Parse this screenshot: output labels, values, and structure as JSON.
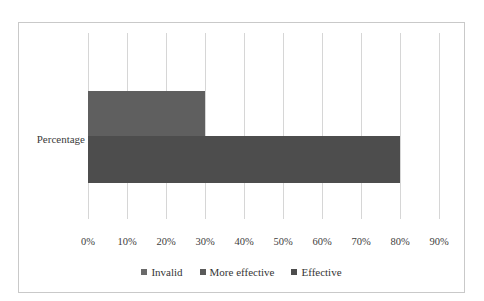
{
  "chart_data": {
    "type": "bar",
    "orientation": "horizontal",
    "stacked": true,
    "title": "",
    "xlabel": "",
    "ylabel": "",
    "categories": [
      "Percentage"
    ],
    "series": [
      {
        "name": "Invalid",
        "values": [
          30
        ],
        "color": "#5f5f5f"
      },
      {
        "name": "More effective",
        "values": [
          50
        ],
        "color": "#4d4d4d"
      },
      {
        "name": "Effective",
        "values": [
          0
        ],
        "color": "#4d4d4d"
      }
    ],
    "xlim": [
      0,
      90
    ],
    "xticks": [
      0,
      10,
      20,
      30,
      40,
      50,
      60,
      70,
      80,
      90
    ],
    "xtick_labels": [
      "0%",
      "10%",
      "20%",
      "30%",
      "40%",
      "50%",
      "60%",
      "70%",
      "80%",
      "90%"
    ],
    "grid": true,
    "grid_axis": "x",
    "legend_position": "bottom",
    "border_color": "#c9c9c9",
    "gridline_color": "#d6d6d6",
    "background": "#ffffff"
  },
  "legend": {
    "items": [
      {
        "label": "Invalid",
        "color": "#6a6a6a"
      },
      {
        "label": "More effective",
        "color": "#5a5a5a"
      },
      {
        "label": "Effective",
        "color": "#4d4d4d"
      }
    ]
  },
  "category_label": "Percentage"
}
